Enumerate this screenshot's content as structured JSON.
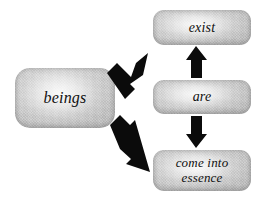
{
  "diagram": {
    "background_color": "#ffffff",
    "node_fill_color": "#cfcfcf",
    "arrow_color": "#0b0b0b",
    "text_color": "#101010",
    "nodes": [
      {
        "id": "beings",
        "label": "beings"
      },
      {
        "id": "exist",
        "label": "exist"
      },
      {
        "id": "are",
        "label": "are"
      },
      {
        "id": "come_into_essence",
        "label": "come into\nessence"
      }
    ],
    "arrows": [
      {
        "id": "beings-to-exist",
        "from": "beings",
        "to": "exist",
        "direction": "up-right",
        "style": "solid-block"
      },
      {
        "id": "beings-to-come-into-essence",
        "from": "beings",
        "to": "come_into_essence",
        "direction": "down-right",
        "style": "solid-block"
      },
      {
        "id": "are-to-exist",
        "from": "are",
        "to": "exist",
        "direction": "up",
        "style": "solid-block"
      },
      {
        "id": "are-to-come-into-essence",
        "from": "are",
        "to": "come_into_essence",
        "direction": "down",
        "style": "solid-block"
      }
    ]
  }
}
